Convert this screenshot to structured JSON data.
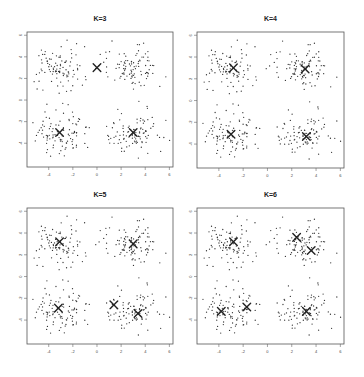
{
  "figure": {
    "width": 364,
    "height": 377,
    "point_color": "#333333",
    "centroid_color": "#222222",
    "frame_color": "#555555"
  },
  "axes": {
    "xlim": [
      -5.8,
      6.3
    ],
    "ylim": [
      -6.2,
      6.3
    ],
    "xticks": [
      -4,
      -2,
      0,
      2,
      4,
      6
    ],
    "xtick_labels": [
      "-4",
      "-2",
      "0",
      "2",
      "4",
      "6"
    ],
    "yticks": [
      6,
      4,
      2,
      0,
      -2,
      -4
    ],
    "ytick_labels": [
      "6",
      "4",
      "2",
      "0",
      "-2",
      "-4"
    ]
  },
  "panels": [
    {
      "title": "K=3",
      "box": {
        "left": 27,
        "top": 32,
        "width": 146,
        "height": 135
      }
    },
    {
      "title": "K=4",
      "box": {
        "left": 197,
        "top": 32,
        "width": 147,
        "height": 136
      }
    },
    {
      "title": "K=5",
      "box": {
        "left": 27,
        "top": 208,
        "width": 146,
        "height": 136
      }
    },
    {
      "title": "K=6",
      "box": {
        "left": 197,
        "top": 208,
        "width": 147,
        "height": 136
      }
    }
  ],
  "chart_data": {
    "type": "scatter",
    "xlabel": "",
    "ylabel": "",
    "xlim": [
      -5.8,
      6.3
    ],
    "ylim": [
      -6.2,
      6.3
    ],
    "grid": false,
    "legend": null,
    "data_generation": {
      "true_clusters": [
        {
          "center": [
            -3,
            3
          ],
          "sd": 1.0,
          "n": 100
        },
        {
          "center": [
            3,
            3
          ],
          "sd": 1.0,
          "n": 100
        },
        {
          "center": [
            -3,
            -3
          ],
          "sd": 1.0,
          "n": 100
        },
        {
          "center": [
            3,
            -3
          ],
          "sd": 1.0,
          "n": 100
        }
      ],
      "seed": 7
    },
    "subplots": [
      {
        "title": "K=3",
        "centroids": [
          [
            0.0,
            3.0
          ],
          [
            -3.1,
            -3.0
          ],
          [
            3.0,
            -3.0
          ]
        ]
      },
      {
        "title": "K=4",
        "centroids": [
          [
            -2.8,
            3.0
          ],
          [
            3.1,
            2.9
          ],
          [
            -3.0,
            -3.1
          ],
          [
            3.2,
            -3.3
          ]
        ]
      },
      {
        "title": "K=5",
        "centroids": [
          [
            -3.1,
            3.2
          ],
          [
            3.0,
            3.0
          ],
          [
            -3.2,
            -2.9
          ],
          [
            1.4,
            -2.6
          ],
          [
            3.4,
            -3.4
          ]
        ]
      },
      {
        "title": "K=6",
        "centroids": [
          [
            -2.8,
            3.2
          ],
          [
            2.4,
            3.6
          ],
          [
            3.6,
            2.4
          ],
          [
            -3.8,
            -3.2
          ],
          [
            -1.7,
            -2.8
          ],
          [
            3.2,
            -3.2
          ]
        ]
      }
    ]
  }
}
